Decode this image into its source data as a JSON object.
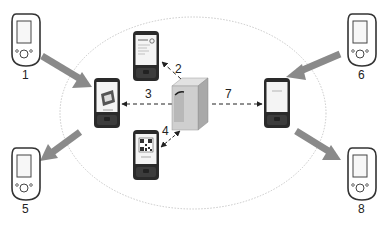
{
  "diagram": {
    "type": "process-flow",
    "boundary": {
      "shape": "ellipse",
      "style": "dotted",
      "color": "#bbbbbb"
    },
    "colors": {
      "big_arrow": "#8a8a8a",
      "dashed_arrow": "#222222",
      "phone_body": "#2a2a2a",
      "screen": "#f4f4f4",
      "server": "#c9c9c9",
      "pda_outline": "#333333"
    },
    "labels": {
      "n1": "1",
      "n2": "2",
      "n3": "3",
      "n4": "4",
      "n5": "5",
      "n6": "6",
      "n7": "7",
      "n8": "8"
    },
    "nodes": [
      {
        "id": "pda-1",
        "kind": "pda-icon",
        "label": "1",
        "position": "top-left"
      },
      {
        "id": "pda-5",
        "kind": "pda-icon",
        "label": "5",
        "position": "bottom-left"
      },
      {
        "id": "pda-6",
        "kind": "pda-icon",
        "label": "6",
        "position": "top-right"
      },
      {
        "id": "pda-8",
        "kind": "pda-icon",
        "label": "8",
        "position": "bottom-right"
      },
      {
        "id": "phone-left",
        "kind": "smartphone",
        "screen": "ticket-graphic"
      },
      {
        "id": "phone-top",
        "kind": "smartphone",
        "screen": "text-document"
      },
      {
        "id": "phone-bottom",
        "kind": "smartphone",
        "screen": "qr-code"
      },
      {
        "id": "phone-right",
        "kind": "smartphone",
        "screen": "blank-message"
      },
      {
        "id": "server",
        "kind": "server-tower"
      }
    ],
    "edges": [
      {
        "from": "pda-1",
        "to": "phone-left",
        "style": "thick-gray"
      },
      {
        "from": "server",
        "to": "phone-top",
        "style": "dashed",
        "label": "2"
      },
      {
        "from": "server",
        "to": "phone-left",
        "style": "dashed",
        "label": "3"
      },
      {
        "from": "server",
        "to": "phone-bottom",
        "style": "dashed-bidirectional",
        "label": "4"
      },
      {
        "from": "phone-left",
        "to": "pda-5",
        "style": "thick-gray"
      },
      {
        "from": "pda-6",
        "to": "phone-right",
        "style": "thick-gray"
      },
      {
        "from": "server",
        "to": "phone-right",
        "style": "dashed",
        "label": "7"
      },
      {
        "from": "phone-right",
        "to": "pda-8",
        "style": "thick-gray"
      }
    ]
  }
}
